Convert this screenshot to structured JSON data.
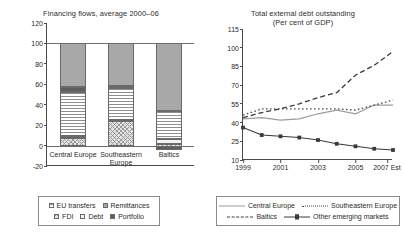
{
  "figure": {
    "width": 404,
    "height": 237,
    "background": "#ffffff"
  },
  "left_panel": {
    "title": "Financing flows, average 2000–06",
    "yticks": [
      "-20",
      "0",
      "20",
      "40",
      "60",
      "80",
      "100",
      "120"
    ],
    "categories": [
      "Central Europe",
      "Southeastern Europe",
      "Baltics"
    ],
    "legend": {
      "row1": [
        "EU transfers",
        "Remittances"
      ],
      "row2": [
        "FDI",
        "Debt",
        "Portfolio"
      ]
    }
  },
  "right_panel": {
    "title_line1": "Total external debt outstanding",
    "title_line2": "(Per cent of GDP)",
    "yticks": [
      "10",
      "25",
      "40",
      "55",
      "70",
      "85",
      "100",
      "115"
    ],
    "xticks": [
      "1999",
      "2001",
      "2003",
      "2005",
      "2007 Est"
    ],
    "legend": {
      "row1": [
        "Central Europe",
        "Southeastern Europe"
      ],
      "row2": [
        "Baltics",
        "Other emerging markets"
      ]
    }
  },
  "chart_data": [
    {
      "type": "bar",
      "id": "financing-flows",
      "title": "Financing flows, average 2000–06",
      "subtitle": "",
      "xlabel": "",
      "ylabel": "",
      "ylim": [
        -20,
        120
      ],
      "ytick_values": [
        -20,
        0,
        20,
        40,
        60,
        80,
        100,
        120
      ],
      "grid": false,
      "stacked": true,
      "note": "Stacked percentage composition of financing flows; each bar totals 100 per cent. Baltics has a small negative Portfolio component below zero.",
      "categories": [
        "Central Europe",
        "Southeastern Europe",
        "Baltics"
      ],
      "series": [
        {
          "name": "FDI",
          "pattern": "cross-hatch",
          "color": "#e3e3e3",
          "values": [
            7,
            24,
            6
          ]
        },
        {
          "name": "Debt",
          "pattern": "solid-light",
          "color": "#f2f2f2",
          "values": [
            2,
            1,
            4
          ]
        },
        {
          "name": "EU transfers",
          "pattern": "horizontal-lines",
          "color": "#ffffff",
          "values": [
            43,
            31,
            28
          ]
        },
        {
          "name": "Portfolio",
          "pattern": "solid-dark",
          "color": "#5d5d5d",
          "values": [
            5,
            2,
            -4
          ]
        },
        {
          "name": "Remittances",
          "pattern": "solid-grey",
          "color": "#a8a8a8",
          "values": [
            43,
            42,
            66
          ]
        }
      ],
      "bar_totals": [
        100,
        100,
        100
      ]
    },
    {
      "type": "line",
      "id": "total-external-debt",
      "title": "Total external debt outstanding",
      "subtitle": "(Per cent of GDP)",
      "xlabel": "",
      "ylabel": "Per cent of GDP",
      "ylim": [
        10,
        115
      ],
      "ytick_values": [
        10,
        25,
        40,
        55,
        70,
        85,
        100,
        115
      ],
      "xlim": [
        1999,
        2007
      ],
      "x": [
        1999,
        2000,
        2001,
        2002,
        2003,
        2004,
        2005,
        2006,
        2007
      ],
      "xtick_values": [
        1999,
        2001,
        2003,
        2005,
        2007
      ],
      "xtick_labels": [
        "1999",
        "2001",
        "2003",
        "2005",
        "2007 Est"
      ],
      "grid": false,
      "legend_position": "bottom",
      "series": [
        {
          "name": "Central Europe",
          "style": "solid",
          "marker": "none",
          "color": "#9c9c9c",
          "values": [
            43,
            44,
            42,
            43,
            47,
            50,
            47,
            54,
            54
          ]
        },
        {
          "name": "Southeastern Europe",
          "style": "dotted",
          "marker": "none",
          "color": "#4a4a4a",
          "values": [
            46,
            51,
            51,
            51,
            51,
            51,
            50,
            54,
            58
          ]
        },
        {
          "name": "Baltics",
          "style": "dashed",
          "marker": "none",
          "color": "#3a3a3a",
          "values": [
            44,
            48,
            51,
            55,
            60,
            64,
            78,
            86,
            97
          ]
        },
        {
          "name": "Other emerging markets",
          "style": "solid",
          "marker": "square",
          "color": "#3a3a3a",
          "values": [
            36,
            30,
            29,
            28,
            26,
            23,
            21,
            19,
            18
          ]
        }
      ]
    }
  ]
}
